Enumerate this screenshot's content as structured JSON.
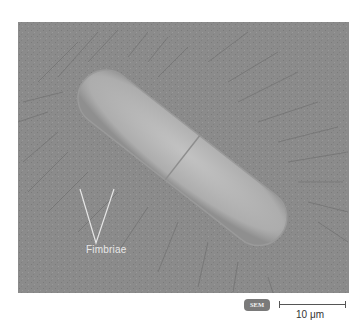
{
  "figure": {
    "type": "scanning-electron-micrograph",
    "annotation_label": "Fimbriae",
    "badge": "SEM",
    "scale_bar_label": "10 μm",
    "colors": {
      "background": "#8a8a8a",
      "cell_body": "#b4b4b4",
      "label": "#e8e8e8",
      "badge_bg": "#7a7a7a"
    }
  }
}
